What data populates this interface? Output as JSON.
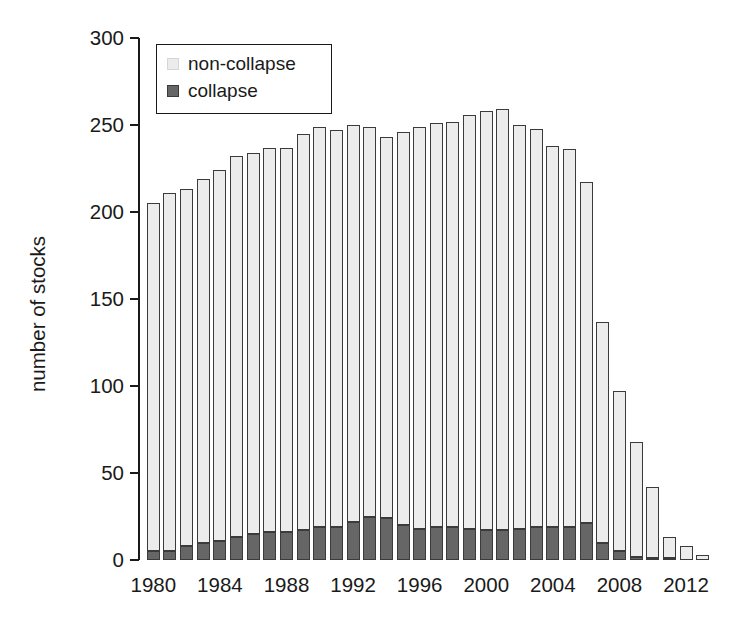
{
  "chart_data": {
    "type": "bar",
    "subtype": "stacked",
    "title": "",
    "xlabel": "",
    "ylabel": "number of stocks",
    "xlim": [
      1979.5,
      2013.5
    ],
    "ylim": [
      0,
      300
    ],
    "yticks": [
      0,
      50,
      100,
      150,
      200,
      250,
      300
    ],
    "xticks": [
      1980,
      1984,
      1988,
      1992,
      1996,
      2000,
      2004,
      2008,
      2012
    ],
    "grid": false,
    "legend": {
      "position": "top-left",
      "entries": [
        {
          "name": "non-collapse",
          "color": "#ececec"
        },
        {
          "name": "collapse",
          "color": "#666666"
        }
      ]
    },
    "categories": [
      1980,
      1981,
      1982,
      1983,
      1984,
      1985,
      1986,
      1987,
      1988,
      1989,
      1990,
      1991,
      1992,
      1993,
      1994,
      1995,
      1996,
      1997,
      1998,
      1999,
      2000,
      2001,
      2002,
      2003,
      2004,
      2005,
      2006,
      2007,
      2008,
      2009,
      2010,
      2011,
      2012,
      2013
    ],
    "series": [
      {
        "name": "collapse",
        "color": "#666666",
        "values": [
          5,
          5,
          8,
          10,
          11,
          13,
          15,
          16,
          16,
          17,
          19,
          19,
          22,
          25,
          24,
          20,
          18,
          19,
          19,
          18,
          17,
          17,
          18,
          19,
          19,
          19,
          21,
          10,
          5,
          2,
          1,
          1,
          0,
          0
        ]
      },
      {
        "name": "non-collapse",
        "color": "#ececec",
        "values": [
          200,
          206,
          205,
          209,
          213,
          219,
          219,
          221,
          221,
          228,
          230,
          228,
          228,
          224,
          219,
          226,
          231,
          232,
          233,
          238,
          241,
          242,
          232,
          229,
          219,
          217,
          196,
          127,
          92,
          66,
          41,
          12,
          8,
          3
        ]
      }
    ],
    "totals": [
      205,
      211,
      213,
      219,
      224,
      232,
      234,
      237,
      237,
      245,
      249,
      247,
      250,
      249,
      243,
      246,
      249,
      251,
      252,
      256,
      258,
      259,
      250,
      248,
      238,
      236,
      217,
      137,
      97,
      68,
      42,
      13,
      8,
      3
    ]
  },
  "axis": {
    "ytick_labels": [
      "0",
      "50",
      "100",
      "150",
      "200",
      "250",
      "300"
    ],
    "xtick_labels": [
      "1980",
      "1984",
      "1988",
      "1992",
      "1996",
      "2000",
      "2004",
      "2008",
      "2012"
    ],
    "ylabel": "number of stocks"
  },
  "legend": {
    "non_collapse_label": "non-collapse",
    "collapse_label": "collapse"
  },
  "colors": {
    "non_collapse_fill": "#ececec",
    "collapse_fill": "#666666",
    "bar_outline": "#3b3b3b",
    "axis": "#1a1a1a",
    "background": "#ffffff"
  }
}
